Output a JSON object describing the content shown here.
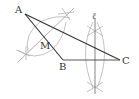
{
  "diagram": {
    "type": "geometric-construction",
    "points": {
      "A": {
        "label": "A",
        "x": 25,
        "y": 14
      },
      "B": {
        "label": "B",
        "x": 63,
        "y": 60
      },
      "C": {
        "label": "C",
        "x": 120,
        "y": 60
      },
      "M": {
        "label": "M",
        "x": 44,
        "y": 37
      }
    },
    "line_label": "ℓ",
    "colors": {
      "segment": "#333333",
      "construction": "#9a9a9a",
      "label": "#333333"
    }
  }
}
